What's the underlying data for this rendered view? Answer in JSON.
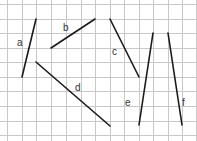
{
  "diagram": {
    "type": "grid-line-segments",
    "grid": {
      "color": "#c8c8c8",
      "vertical_x": [
        7,
        22,
        36,
        51,
        66,
        81,
        95,
        110,
        124,
        139,
        153,
        168,
        182,
        196
      ],
      "horizontal_y": [
        4,
        19,
        33,
        48,
        62,
        77,
        91,
        106,
        121,
        135
      ]
    },
    "segment_color": "#1a1a1a",
    "segments": [
      {
        "label": "a",
        "x1": 36,
        "y1": 19,
        "x2": 22,
        "y2": 77,
        "label_x": 17,
        "label_y": 46
      },
      {
        "label": "b",
        "x1": 51,
        "y1": 48,
        "x2": 95,
        "y2": 19,
        "label_x": 63,
        "label_y": 31
      },
      {
        "label": "c",
        "x1": 110,
        "y1": 19,
        "x2": 139,
        "y2": 77,
        "label_x": 112,
        "label_y": 55
      },
      {
        "label": "d",
        "x1": 36,
        "y1": 62,
        "x2": 110,
        "y2": 126,
        "label_x": 75,
        "label_y": 91
      },
      {
        "label": "e",
        "x1": 153,
        "y1": 33,
        "x2": 139,
        "y2": 125,
        "label_x": 125,
        "label_y": 106
      },
      {
        "label": "f",
        "x1": 168,
        "y1": 33,
        "x2": 182,
        "y2": 125,
        "label_x": 182,
        "label_y": 106
      }
    ]
  }
}
